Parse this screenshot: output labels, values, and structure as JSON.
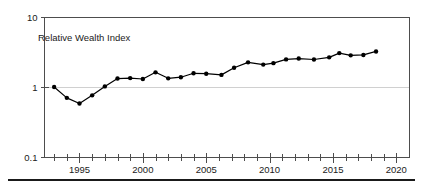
{
  "chart_data": {
    "type": "line",
    "title": "Relative Wealth Index",
    "xlabel": "",
    "ylabel": "",
    "yscale": "log",
    "ylim": [
      0.1,
      10
    ],
    "xlim": [
      1992.2,
      2021.0
    ],
    "grid": "y-gridline at 1",
    "legend": "none",
    "y_ticks": [
      {
        "value": 10,
        "label": "10"
      },
      {
        "value": 1,
        "label": "1"
      },
      {
        "value": 0.1,
        "label": "0.1"
      }
    ],
    "x_ticks_major": [
      {
        "value": 1995,
        "label": "1995"
      },
      {
        "value": 2000,
        "label": "2000"
      },
      {
        "value": 2005,
        "label": "2005"
      },
      {
        "value": 2010,
        "label": "2010"
      },
      {
        "value": 2015,
        "label": "2015"
      },
      {
        "value": 2020,
        "label": "2020"
      }
    ],
    "x_ticks_minor_step": 1,
    "series": [
      {
        "name": "Relative Wealth Index",
        "x": [
          1993.0,
          1994.0,
          1995.0,
          1996.0,
          1997.0,
          1998.0,
          1999.0,
          2000.0,
          2001.0,
          2002.0,
          2003.0,
          2004.0,
          2005.0,
          2006.2,
          2007.2,
          2008.3,
          2009.5,
          2010.3,
          2011.3,
          2012.3,
          2013.5,
          2014.7,
          2015.5,
          2016.4,
          2017.4,
          2018.4
        ],
        "values": [
          1.0,
          0.7,
          0.58,
          0.76,
          1.02,
          1.32,
          1.34,
          1.3,
          1.62,
          1.33,
          1.38,
          1.57,
          1.55,
          1.49,
          1.88,
          2.25,
          2.09,
          2.19,
          2.48,
          2.55,
          2.47,
          2.65,
          3.05,
          2.83,
          2.87,
          3.22
        ]
      }
    ]
  }
}
